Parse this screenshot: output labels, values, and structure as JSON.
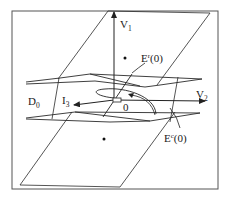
{
  "figure": {
    "labels": {
      "v1": {
        "base": "V",
        "sub": "1"
      },
      "v2": {
        "base": "V",
        "sub": "2"
      },
      "d0": {
        "base": "D",
        "sub": "0"
      },
      "i3": {
        "base": "I",
        "sub": "3"
      },
      "origin": "0",
      "er": {
        "base": "E",
        "sup": "r",
        "arg": "(0)"
      },
      "ec": {
        "base": "E",
        "sup": "c",
        "arg": "(0)"
      }
    },
    "colors": {
      "stroke": "#2a2a2a",
      "background": "#ffffff"
    }
  }
}
